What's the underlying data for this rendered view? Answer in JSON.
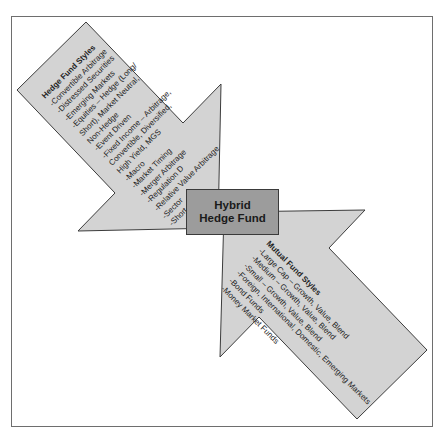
{
  "center": {
    "line1": "Hybrid",
    "line2": "Hedge Fund"
  },
  "hedge_fund": {
    "title": "Hedge Fund Styles",
    "items": [
      "-Convertible Arbitrage",
      "-Distressed Securities",
      "-Emerging Markets",
      "-Equities – Hedge (Long/",
      "Short), Market Neutral,",
      "Non-Hedge",
      "-Event Driven",
      "-Fixed Income – Arbitrage,",
      "Convertible, Diversified,",
      "High Yield, MGS",
      "-Macro",
      "-Market Timing",
      "-Merger Arbitrage",
      "-Regulation D",
      "-Relative Value Arbitrage",
      "-Sector",
      "-Short Selling"
    ]
  },
  "mutual_fund": {
    "title": "Mutual Fund Styles",
    "items": [
      "-Large Cap – Growth, Value, Blend",
      "-Medium – Growth, Value, Blend",
      "-Small – Growth, Value, Blend",
      "-Foreign, International, Domestic, Emerging Markets",
      "-Bond Funds",
      "-Money Market Funds"
    ]
  },
  "colors": {
    "arrow_fill": "#d3d3d3",
    "arrow_stroke": "#3c3c3c",
    "box_fill": "#9c9c9c"
  }
}
